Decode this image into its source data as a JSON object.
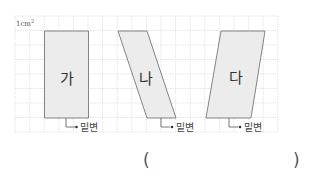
{
  "grid": {
    "unit_label": "1cm",
    "unit_superscript": "2",
    "cols": 18,
    "rows": 8
  },
  "shapes": [
    {
      "name": "가",
      "base_label": "밑변"
    },
    {
      "name": "나",
      "base_label": "밑변"
    },
    {
      "name": "다",
      "base_label": "밑변"
    }
  ],
  "answer": {
    "open_paren": "(",
    "close_paren": ")"
  },
  "colors": {
    "grid": "#dcdcdc",
    "shape_fill": "#ececec",
    "shape_stroke": "#777777"
  }
}
